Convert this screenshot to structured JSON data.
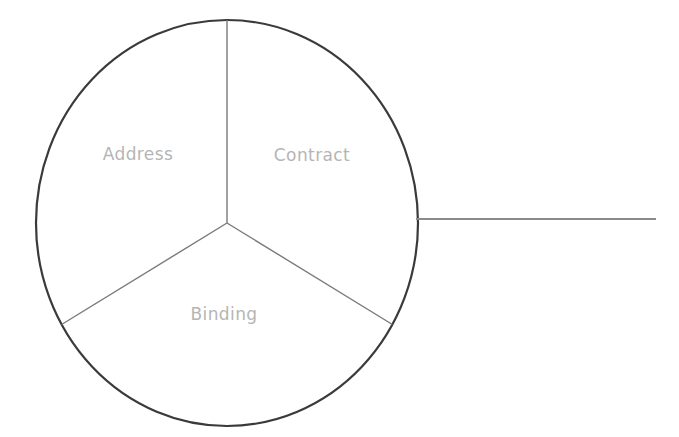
{
  "diagram": {
    "type": "pie-sector-diagram",
    "background_color": "#ffffff",
    "circle": {
      "name": "pie-circle",
      "center_x": 227,
      "center_y": 223,
      "radius_x": 191,
      "radius_y": 203,
      "stroke_color": "#3a3a3a",
      "stroke_width": 2.2
    },
    "divider_color": "#7a7a7a",
    "divider_width": 1.4,
    "dividers": [
      {
        "name": "divider-top",
        "angle_deg": 90,
        "from": "center",
        "to_edge": true
      },
      {
        "name": "divider-lower-left",
        "angle_deg": 210,
        "from": "center",
        "to_edge": true
      },
      {
        "name": "divider-lower-right",
        "angle_deg": 330,
        "from": "center",
        "to_edge": true
      }
    ],
    "leader_line": {
      "name": "leader-line",
      "x1": 416,
      "y1": 219,
      "x2": 656,
      "y2": 219,
      "stroke_color": "#8a8a8a",
      "stroke_width": 2.0
    },
    "label_color": "#b5b5b5",
    "sectors": [
      {
        "name": "sector-address",
        "label": "Address",
        "share_percent": 33.3,
        "start_angle_deg": 90,
        "end_angle_deg": 210
      },
      {
        "name": "sector-contract",
        "label": "Contract",
        "share_percent": 33.3,
        "start_angle_deg": 330,
        "end_angle_deg": 90
      },
      {
        "name": "sector-binding",
        "label": "Binding",
        "share_percent": 33.3,
        "start_angle_deg": 210,
        "end_angle_deg": 330
      }
    ]
  },
  "chart_data": {
    "type": "pie",
    "title": "",
    "categories": [
      "Address",
      "Contract",
      "Binding"
    ],
    "values": [
      33.3,
      33.3,
      33.3
    ],
    "legend_position": "none",
    "labels_inside_slices": true
  }
}
